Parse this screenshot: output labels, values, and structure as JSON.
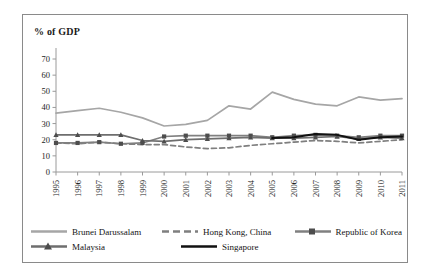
{
  "chart_data": {
    "type": "line",
    "title": "% of GDP",
    "xlabel": "",
    "ylabel": "",
    "ylim": [
      0,
      70
    ],
    "yticks": [
      0,
      10,
      20,
      30,
      40,
      50,
      60,
      70
    ],
    "grid": false,
    "legend_position": "bottom",
    "categories": [
      "1995",
      "1996",
      "1997",
      "1998",
      "1999",
      "2000",
      "2001",
      "2002",
      "2003",
      "2004",
      "2005",
      "2006",
      "2007",
      "2008",
      "2009",
      "2010",
      "2011"
    ],
    "series": [
      {
        "name": "Brunei Darussalam",
        "color": "#a6a6a6",
        "style": "solid",
        "marker": "none",
        "values": [
          36.5,
          38.0,
          39.5,
          37.0,
          33.5,
          28.5,
          29.5,
          32.0,
          41.0,
          39.0,
          49.5,
          45.0,
          42.0,
          41.0,
          46.5,
          44.5,
          45.5
        ]
      },
      {
        "name": "Hong Kong, China",
        "color": "#7f7f7f",
        "style": "dashed",
        "marker": "none",
        "values": [
          18.0,
          17.5,
          18.5,
          17.5,
          17.0,
          17.0,
          15.5,
          14.5,
          15.0,
          16.5,
          17.5,
          18.5,
          19.5,
          19.0,
          18.0,
          19.0,
          20.0
        ]
      },
      {
        "name": "Republic of Korea",
        "color": "#808080",
        "style": "solid",
        "marker": "square",
        "values": [
          18.0,
          18.0,
          18.5,
          17.5,
          18.0,
          22.0,
          22.5,
          22.5,
          22.5,
          22.5,
          21.5,
          22.5,
          23.0,
          22.5,
          21.5,
          22.5,
          22.5
        ]
      },
      {
        "name": "Malaysia",
        "color": "#6e6e6e",
        "style": "solid",
        "marker": "triangle",
        "values": [
          23.0,
          23.0,
          23.0,
          23.0,
          19.5,
          19.0,
          20.0,
          20.5,
          21.0,
          21.5,
          21.0,
          21.0,
          21.5,
          22.0,
          20.5,
          21.5,
          21.0
        ]
      },
      {
        "name": "Singapore",
        "color": "#111111",
        "style": "solid",
        "marker": "none",
        "values": [
          null,
          null,
          null,
          null,
          null,
          null,
          null,
          null,
          null,
          null,
          21.0,
          21.5,
          23.5,
          23.0,
          20.0,
          21.5,
          22.0
        ]
      }
    ]
  },
  "legend": {
    "items": [
      {
        "label": "Brunei Darussalam"
      },
      {
        "label": "Hong Kong, China"
      },
      {
        "label": "Republic of Korea"
      },
      {
        "label": "Malaysia"
      },
      {
        "label": "Singapore"
      }
    ]
  }
}
